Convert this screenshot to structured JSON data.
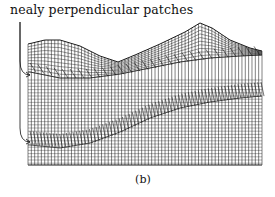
{
  "figure": {
    "annotation": "nealy perpendicular patches",
    "caption": "(b)",
    "mesh": {
      "x_left": 28,
      "x_right": 262,
      "y_bottom": 165,
      "columns": 70,
      "top_curve": [
        [
          28,
          44
        ],
        [
          45,
          40
        ],
        [
          60,
          40
        ],
        [
          80,
          46
        ],
        [
          100,
          56
        ],
        [
          118,
          62
        ],
        [
          135,
          55
        ],
        [
          160,
          44
        ],
        [
          185,
          32
        ],
        [
          200,
          23
        ],
        [
          212,
          28
        ],
        [
          230,
          40
        ],
        [
          250,
          48
        ],
        [
          262,
          51
        ]
      ],
      "seam_upper": [
        [
          30,
          72
        ],
        [
          60,
          78
        ],
        [
          90,
          78
        ],
        [
          120,
          74
        ],
        [
          150,
          68
        ],
        [
          180,
          62
        ],
        [
          210,
          58
        ],
        [
          240,
          56
        ],
        [
          262,
          55
        ]
      ],
      "seam_lower": [
        [
          30,
          145
        ],
        [
          60,
          148
        ],
        [
          90,
          143
        ],
        [
          120,
          132
        ],
        [
          150,
          118
        ],
        [
          180,
          108
        ],
        [
          210,
          102
        ],
        [
          240,
          98
        ],
        [
          262,
          96
        ]
      ],
      "line_color": "#1a1a1a"
    },
    "arrows": [
      {
        "from": [
          20,
          22
        ],
        "to": [
          30,
          75
        ]
      },
      {
        "from": [
          20,
          22
        ],
        "to": [
          30,
          142
        ]
      }
    ]
  }
}
